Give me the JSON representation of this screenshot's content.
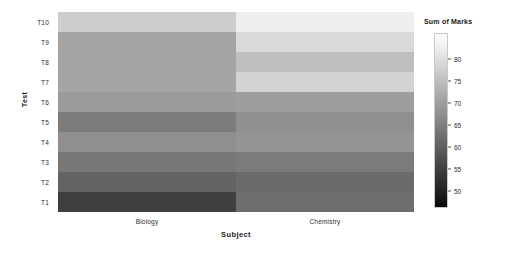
{
  "chart_data": {
    "type": "heatmap",
    "title": "",
    "xlabel": "Subject",
    "ylabel": "Test",
    "categories_x": [
      "Biology",
      "Chemistry"
    ],
    "categories_y": [
      "T10",
      "T9",
      "T8",
      "T7",
      "T6",
      "T5",
      "T4",
      "T3",
      "T2",
      "T1"
    ],
    "colorbar": {
      "label": "Sum of Marks",
      "ticks": [
        80,
        75,
        70,
        65,
        60,
        55,
        50
      ],
      "tick_labels": [
        "80",
        "75",
        "70",
        "65",
        "60",
        "55",
        "50"
      ],
      "vmin": 46,
      "vmax": 86,
      "colormap": "gray",
      "orientation": "vertical",
      "position": "right"
    },
    "rows": [
      {
        "y": "T10",
        "values": [
          79,
          85
        ],
        "colors": [
          "#cdcdcd",
          "#efefef"
        ]
      },
      {
        "y": "T9",
        "values": [
          70,
          81
        ],
        "colors": [
          "#a5a5a5",
          "#d9d9d9"
        ]
      },
      {
        "y": "T8",
        "values": [
          70,
          76
        ],
        "colors": [
          "#a5a5a5",
          "#bebebe"
        ]
      },
      {
        "y": "T7",
        "values": [
          70,
          80
        ],
        "colors": [
          "#a5a5a5",
          "#d3d3d3"
        ]
      },
      {
        "y": "T6",
        "values": [
          68,
          69
        ],
        "colors": [
          "#9b9b9b",
          "#9e9e9e"
        ]
      },
      {
        "y": "T5",
        "values": [
          61,
          66
        ],
        "colors": [
          "#7c7c7c",
          "#909090"
        ]
      },
      {
        "y": "T4",
        "values": [
          66,
          67
        ],
        "colors": [
          "#8f8f8f",
          "#959595"
        ]
      },
      {
        "y": "T3",
        "values": [
          60,
          61
        ],
        "colors": [
          "#777777",
          "#7b7b7b"
        ]
      },
      {
        "y": "T2",
        "values": [
          55,
          57
        ],
        "colors": [
          "#636363",
          "#6a6a6a"
        ]
      },
      {
        "y": "T1",
        "values": [
          48,
          58
        ],
        "colors": [
          "#3f3f3f",
          "#6e6e6e"
        ]
      }
    ],
    "grid": false,
    "axis_ranges": {
      "x": [
        0,
        2
      ],
      "y": [
        0,
        10
      ]
    }
  },
  "axis": {
    "y_title": "Test",
    "x_title": "Subject"
  }
}
